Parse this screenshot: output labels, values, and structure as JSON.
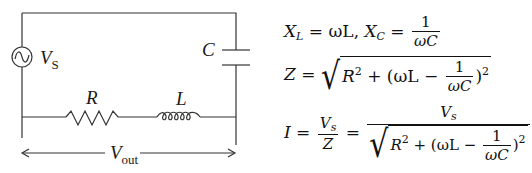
{
  "circuit": {
    "source_label": "V",
    "source_subscript": "S",
    "capacitor_label": "C",
    "resistor_label": "R",
    "inductor_label": "L",
    "output_label": "V",
    "output_subscript": "out",
    "source_icon": "ac-source-icon",
    "wire_color": "#333333"
  },
  "equations": {
    "eq1": {
      "lhs1": "X",
      "lhs1_sub": "L",
      "mid1": " = ωL, ",
      "lhs2": "X",
      "lhs2_sub": "C",
      "eq": " = ",
      "num": "1",
      "den": "ωC"
    },
    "eq2": {
      "lhs": "Z",
      "eq": " = ",
      "r": "R",
      "r_exp": "2",
      "plus_open": " + (ωL − ",
      "num": "1",
      "den": "ωC",
      "close": ")",
      "close_exp": "2"
    },
    "eq3": {
      "lhs": "I",
      "eq1": " = ",
      "num1": "V",
      "num1_sub": "s",
      "den1": "Z",
      "eq2": " = ",
      "num2": "V",
      "num2_sub": "s",
      "r": "R",
      "r_exp": "2",
      "plus_open": " + (ωL − ",
      "num": "1",
      "den": "ωC",
      "close": ")",
      "close_exp": "2"
    }
  }
}
